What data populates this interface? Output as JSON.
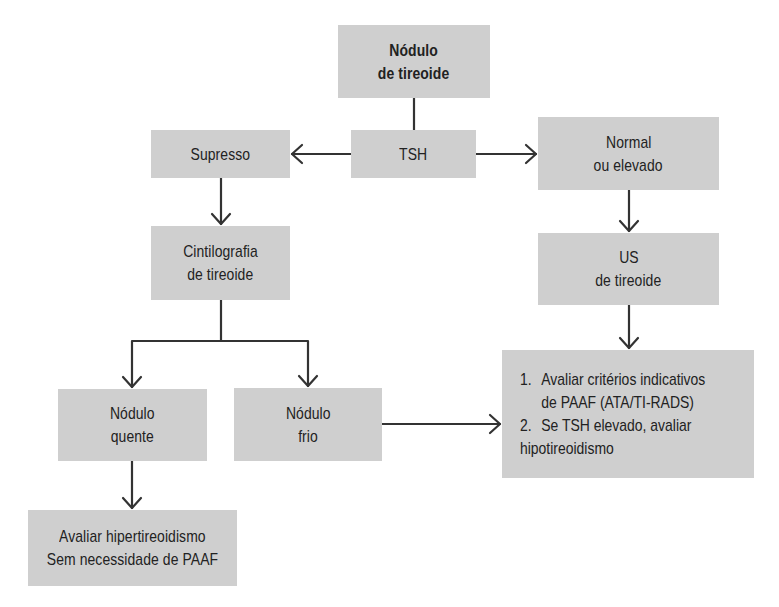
{
  "diagram": {
    "type": "flowchart",
    "colors": {
      "box_fill": "#cfcfcf",
      "line": "#333333",
      "text": "#222222",
      "background": "#ffffff"
    },
    "nodes": {
      "root": {
        "lines": [
          "Nódulo",
          "de tireoide"
        ]
      },
      "tsh": {
        "lines": [
          "TSH"
        ]
      },
      "supresso": {
        "lines": [
          "Supresso"
        ]
      },
      "normal": {
        "lines": [
          "Normal",
          "ou elevado"
        ]
      },
      "cintilografia": {
        "lines": [
          "Cintilografia",
          "de tireoide"
        ]
      },
      "us": {
        "lines": [
          "US",
          "de tireoide"
        ]
      },
      "quente": {
        "lines": [
          "Nódulo",
          "quente"
        ]
      },
      "frio": {
        "lines": [
          "Nódulo",
          "frio"
        ]
      },
      "hiper": {
        "lines": [
          "Avaliar hipertireoidismo",
          "Sem necessidade de PAAF"
        ]
      },
      "final": {
        "items": [
          {
            "num": "1.",
            "lines": [
              "Avaliar critérios indicativos",
              "de PAAF (ATA/TI-RADS)"
            ]
          },
          {
            "num": "2.",
            "lines": [
              "Se TSH elevado, avaliar",
              "hipotireoidismo"
            ]
          }
        ]
      }
    },
    "edges": [
      {
        "from": "root",
        "to": "tsh",
        "arrow": false
      },
      {
        "from": "tsh",
        "to": "supresso",
        "arrow": true
      },
      {
        "from": "tsh",
        "to": "normal",
        "arrow": true
      },
      {
        "from": "supresso",
        "to": "cintilografia",
        "arrow": true
      },
      {
        "from": "normal",
        "to": "us",
        "arrow": true
      },
      {
        "from": "cintilografia",
        "to": "quente",
        "arrow": true
      },
      {
        "from": "cintilografia",
        "to": "frio",
        "arrow": true
      },
      {
        "from": "us",
        "to": "final",
        "arrow": true
      },
      {
        "from": "frio",
        "to": "final",
        "arrow": true
      },
      {
        "from": "quente",
        "to": "hiper",
        "arrow": true
      }
    ]
  }
}
